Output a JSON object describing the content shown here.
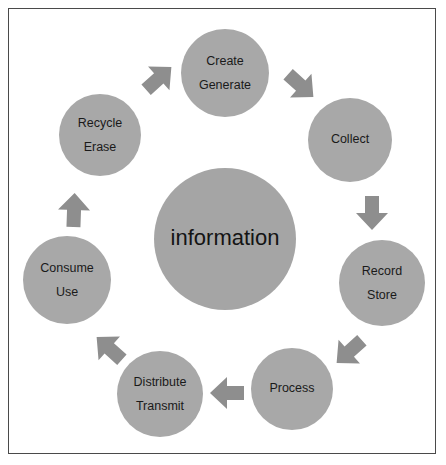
{
  "diagram": {
    "hub": {
      "label": "information",
      "cx": 225,
      "cy": 239,
      "r": 71,
      "color": "#a5a5a5"
    },
    "colors": {
      "node_fill": "#a8a8a8",
      "hub_fill": "#a5a5a5",
      "arrow_fill": "#8e8e8e",
      "label_text": "#1a1a1a",
      "border": "#4a4a4a",
      "background": "#ffffff"
    },
    "nodes": [
      {
        "name": "create-generate",
        "lines": [
          "Create",
          "Generate"
        ],
        "line1": "Create",
        "line2": "Generate",
        "cx": 225,
        "cy": 73,
        "r": 44
      },
      {
        "name": "collect",
        "lines": [
          "Collect"
        ],
        "line1": "Collect",
        "line2": "",
        "cx": 350,
        "cy": 140,
        "r": 42
      },
      {
        "name": "record-store",
        "lines": [
          "Record",
          "Store"
        ],
        "line1": "Record",
        "line2": "Store",
        "cx": 382,
        "cy": 283,
        "r": 43
      },
      {
        "name": "process",
        "lines": [
          "Process"
        ],
        "line1": "Process",
        "line2": "",
        "cx": 292,
        "cy": 389,
        "r": 41
      },
      {
        "name": "distribute-transmit",
        "lines": [
          "Distribute",
          "Transmit"
        ],
        "line1": "Distribute",
        "line2": "Transmit",
        "cx": 160,
        "cy": 394,
        "r": 43
      },
      {
        "name": "consume-use",
        "lines": [
          "Consume",
          "Use"
        ],
        "line1": "Consume",
        "line2": "Use",
        "cx": 67,
        "cy": 280,
        "r": 44
      },
      {
        "name": "recycle-erase",
        "lines": [
          "Recycle",
          "Erase"
        ],
        "line1": "Recycle",
        "line2": "Erase",
        "cx": 100,
        "cy": 135,
        "r": 41
      }
    ],
    "arrows": [
      {
        "name": "arrow-recycle-to-create",
        "from": "recycle-erase",
        "to": "create-generate",
        "direction": "up-right",
        "cx": 158,
        "cy": 79,
        "angle": -42
      },
      {
        "name": "arrow-create-to-collect",
        "from": "create-generate",
        "to": "collect",
        "direction": "down-right",
        "cx": 300,
        "cy": 85,
        "angle": 42
      },
      {
        "name": "arrow-collect-to-record",
        "from": "collect",
        "to": "record-store",
        "direction": "down",
        "cx": 372,
        "cy": 212,
        "angle": 90
      },
      {
        "name": "arrow-record-to-process",
        "from": "record-store",
        "to": "process",
        "direction": "down-left",
        "cx": 350,
        "cy": 351,
        "angle": 138
      },
      {
        "name": "arrow-process-to-distribute",
        "from": "process",
        "to": "distribute-transmit",
        "direction": "left",
        "cx": 228,
        "cy": 393,
        "angle": 180
      },
      {
        "name": "arrow-distribute-to-consume",
        "from": "distribute-transmit",
        "to": "consume-use",
        "direction": "up-left",
        "cx": 110,
        "cy": 349,
        "angle": 222
      },
      {
        "name": "arrow-consume-to-recycle",
        "from": "consume-use",
        "to": "recycle-erase",
        "direction": "up",
        "cx": 74,
        "cy": 211,
        "angle": 272
      }
    ]
  }
}
